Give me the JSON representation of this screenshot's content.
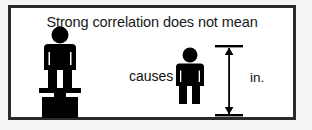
{
  "figure": {
    "caption": "Strong correlation does not mean",
    "relation_label": "causes",
    "weight_unit": "lb.",
    "height_unit": "in.",
    "colors": {
      "ink": "#000000",
      "border": "#2a2a2a",
      "panel_background": "#ffffff",
      "page_background": "#f4f4f4",
      "label_on_black": "#ffffff"
    },
    "left_subject": {
      "name": "person-on-scale",
      "description": "pictogram person standing on a weighing scale"
    },
    "right_subject": {
      "name": "person-with-height-measure",
      "description": "pictogram person beside a vertical double-headed measurement arrow"
    }
  }
}
